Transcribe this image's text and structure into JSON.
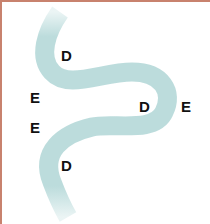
{
  "diagram": {
    "tube_color": "#bcdcdc",
    "border_color": "#c8826e",
    "labels": [
      {
        "text": "D",
        "x": 59,
        "y": 46
      },
      {
        "text": "E",
        "x": 28,
        "y": 88
      },
      {
        "text": "D",
        "x": 137,
        "y": 97
      },
      {
        "text": "E",
        "x": 179,
        "y": 97
      },
      {
        "text": "E",
        "x": 28,
        "y": 118
      },
      {
        "text": "D",
        "x": 59,
        "y": 156
      }
    ]
  }
}
